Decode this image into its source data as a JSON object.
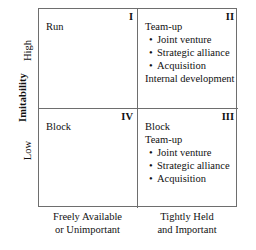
{
  "chart_data": {
    "type": "table",
    "title": "",
    "xlabel": "",
    "ylabel": "Imitability",
    "grid": true,
    "legend": "none",
    "x_categories": [
      "Freely Available or Unimportant",
      "Tightly Held and Important"
    ],
    "y_categories": [
      "High",
      "Low"
    ],
    "quadrants": [
      {
        "numeral": "I",
        "row": "High",
        "column": "Freely Available or Unimportant",
        "heading": "Run",
        "bullets": [],
        "footer": ""
      },
      {
        "numeral": "II",
        "row": "High",
        "column": "Tightly Held and Important",
        "heading": "Team-up",
        "bullets": [
          "Joint venture",
          "Strategic alliance",
          "Acquisition"
        ],
        "footer": "Internal development"
      },
      {
        "numeral": "IV",
        "row": "Low",
        "column": "Freely Available or Unimportant",
        "heading": "Block",
        "bullets": [],
        "footer": ""
      },
      {
        "numeral": "III",
        "row": "Low",
        "column": "Tightly Held and Important",
        "heading": "Block",
        "subheading": "Team-up",
        "bullets": [
          "Joint venture",
          "Strategic alliance",
          "Acquisition"
        ],
        "footer": ""
      }
    ]
  },
  "axes": {
    "y_title": "Imitability",
    "y_tick_high": "High",
    "y_tick_low": "Low",
    "x_left_line1": "Freely Available",
    "x_left_line2": "or Unimportant",
    "x_right_line1": "Tightly Held",
    "x_right_line2": "and Important"
  },
  "quadrant_1": {
    "numeral": "I",
    "heading": "Run"
  },
  "quadrant_2": {
    "numeral": "II",
    "heading": "Team-up",
    "bullet_1": "Joint venture",
    "bullet_2": "Strategic alliance",
    "bullet_3": "Acquisition",
    "footer": "Internal development"
  },
  "quadrant_4": {
    "numeral": "IV",
    "heading": "Block"
  },
  "quadrant_3": {
    "numeral": "III",
    "heading": "Block",
    "subheading": "Team-up",
    "bullet_1": "Joint venture",
    "bullet_2": "Strategic alliance",
    "bullet_3": "Acquisition"
  },
  "colors": {
    "border": "#6e6e6e",
    "text": "#111111",
    "background": "#ffffff"
  }
}
